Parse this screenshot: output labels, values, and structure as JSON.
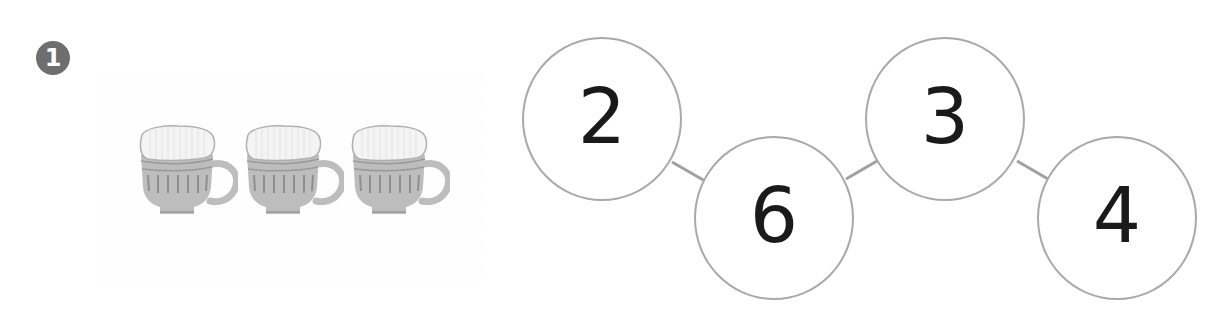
{
  "problem": {
    "number": "1",
    "badge_icon": "numbered-circle-badge"
  },
  "picture": {
    "item": "cup",
    "count": 3,
    "icon": "teacup-icon",
    "colors": {
      "body": "#bdbdbd",
      "stripe": "#8f8f8f",
      "foam": "#f4f4f4"
    }
  },
  "number_chain": {
    "nodes": [
      {
        "value": "2"
      },
      {
        "value": "6"
      },
      {
        "value": "3"
      },
      {
        "value": "4"
      }
    ],
    "connector_color": "#a0a0a0",
    "circle_border_color": "#a9a9a9"
  }
}
